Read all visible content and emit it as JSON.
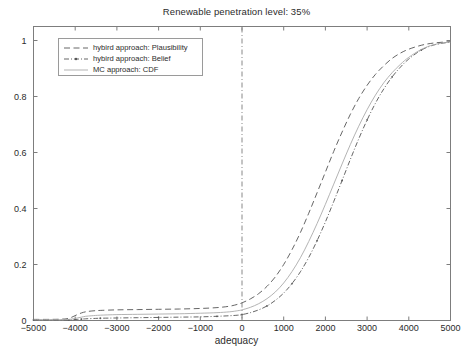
{
  "chart_data": {
    "type": "line",
    "title": "Renewable penetration level: 35%",
    "xlabel": "adequacy",
    "ylabel": "",
    "xlim": [
      -5000,
      5000
    ],
    "ylim": [
      0,
      1.05
    ],
    "xticks": [
      -5000,
      -4000,
      -3000,
      -2000,
      -1000,
      0,
      1000,
      2000,
      3000,
      4000,
      5000
    ],
    "xtick_labels": [
      "−5000",
      "−4000",
      "−3000",
      "−2000",
      "−1000",
      "0",
      "1000",
      "2000",
      "3000",
      "4000",
      "5000"
    ],
    "yticks": [
      0,
      0.2,
      0.4,
      0.6,
      0.8,
      1
    ],
    "ytick_labels": [
      "0",
      "0.2",
      "0.4",
      "0.6",
      "0.8",
      "1"
    ],
    "grid": false,
    "legend_position": "upper left",
    "reference_line": {
      "name": "zero-adequacy-line",
      "x": 0,
      "style": "dash-dot",
      "color": "#888888"
    },
    "series": [
      {
        "name": "hybird approach: Plausibility",
        "style": "dashed",
        "color": "#555555",
        "marker": "none",
        "x": [
          -5000,
          -4600,
          -4300,
          -4150,
          -4050,
          -3950,
          -3850,
          -3750,
          -3600,
          -3400,
          -3000,
          -2500,
          -2000,
          -1500,
          -1000,
          -600,
          -300,
          -100,
          0,
          200,
          400,
          600,
          800,
          1000,
          1200,
          1400,
          1600,
          1800,
          2000,
          2200,
          2400,
          2600,
          2800,
          3000,
          3200,
          3400,
          3600,
          3800,
          4000,
          4300,
          4600,
          5000
        ],
        "y": [
          0.004,
          0.004,
          0.005,
          0.008,
          0.014,
          0.021,
          0.027,
          0.031,
          0.034,
          0.036,
          0.038,
          0.039,
          0.04,
          0.041,
          0.043,
          0.046,
          0.051,
          0.058,
          0.063,
          0.077,
          0.096,
          0.122,
          0.156,
          0.2,
          0.253,
          0.314,
          0.383,
          0.456,
          0.53,
          0.604,
          0.673,
          0.737,
          0.793,
          0.84,
          0.879,
          0.91,
          0.936,
          0.955,
          0.969,
          0.983,
          0.991,
          0.996
        ]
      },
      {
        "name": "hybird approach: Belief",
        "style": "dash-dot",
        "color": "#555555",
        "marker": "dot",
        "x": [
          -5000,
          -4600,
          -4300,
          -4150,
          -4050,
          -3950,
          -3850,
          -3750,
          -3600,
          -3400,
          -3000,
          -2500,
          -2000,
          -1500,
          -1000,
          -600,
          -300,
          -100,
          0,
          200,
          400,
          600,
          800,
          1000,
          1200,
          1400,
          1600,
          1800,
          2000,
          2200,
          2400,
          2600,
          2800,
          3000,
          3200,
          3400,
          3600,
          3800,
          4000,
          4300,
          4600,
          5000
        ],
        "y": [
          0.002,
          0.002,
          0.002,
          0.002,
          0.003,
          0.004,
          0.005,
          0.006,
          0.007,
          0.008,
          0.009,
          0.01,
          0.011,
          0.012,
          0.013,
          0.015,
          0.017,
          0.019,
          0.021,
          0.028,
          0.038,
          0.052,
          0.072,
          0.098,
          0.132,
          0.174,
          0.225,
          0.285,
          0.352,
          0.425,
          0.5,
          0.576,
          0.649,
          0.716,
          0.776,
          0.827,
          0.87,
          0.905,
          0.934,
          0.966,
          0.984,
          0.995
        ]
      },
      {
        "name": "MC approach: CDF",
        "style": "solid",
        "color": "#aaaaaa",
        "marker": "none",
        "x": [
          -5000,
          -4600,
          -4300,
          -4150,
          -4050,
          -3950,
          -3850,
          -3750,
          -3600,
          -3400,
          -3000,
          -2500,
          -2000,
          -1500,
          -1000,
          -600,
          -300,
          -100,
          0,
          200,
          400,
          600,
          800,
          1000,
          1200,
          1400,
          1600,
          1800,
          2000,
          2200,
          2400,
          2600,
          2800,
          3000,
          3200,
          3400,
          3600,
          3800,
          4000,
          4300,
          4600,
          5000
        ],
        "y": [
          0.003,
          0.003,
          0.003,
          0.004,
          0.006,
          0.009,
          0.012,
          0.015,
          0.017,
          0.019,
          0.021,
          0.022,
          0.023,
          0.024,
          0.026,
          0.028,
          0.031,
          0.035,
          0.038,
          0.047,
          0.06,
          0.078,
          0.102,
          0.134,
          0.175,
          0.224,
          0.282,
          0.346,
          0.415,
          0.487,
          0.559,
          0.629,
          0.694,
          0.753,
          0.805,
          0.849,
          0.885,
          0.915,
          0.94,
          0.968,
          0.985,
          0.995
        ]
      }
    ]
  },
  "legend": {
    "items": [
      {
        "label": "hybird approach: Plausibility"
      },
      {
        "label": "hybird approach: Belief"
      },
      {
        "label": "MC approach: CDF"
      }
    ]
  }
}
